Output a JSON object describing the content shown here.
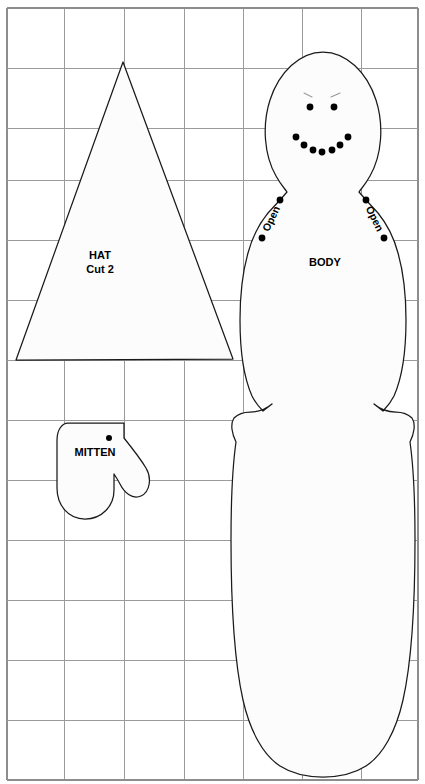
{
  "sheet": {
    "title": "Snowman Sewing Pattern Sheet",
    "width": 425,
    "height": 784,
    "background_color": "#ffffff"
  },
  "grid": {
    "line_color": "#9b9b9b",
    "border_color": "#8d8d8d",
    "x_lines": [
      7,
      64,
      124,
      184,
      243,
      302,
      361,
      418
    ],
    "y_lines": [
      8,
      68,
      128,
      180,
      240,
      300,
      360,
      420,
      480,
      540,
      600,
      660,
      720,
      780
    ],
    "left": 7,
    "right": 418,
    "top": 8,
    "bottom": 780
  },
  "pieces": {
    "hat": {
      "label": "HAT",
      "cut_label": "Cut 2",
      "label_x": 100,
      "label_y": 256,
      "cut_label_x": 100,
      "cut_label_y": 270,
      "apex_x": 123,
      "apex_y": 62,
      "base_left_x": 16,
      "base_right_x": 233,
      "base_y": 360,
      "outline_path": "M 123 62 L 233 359 L 16 360 Z",
      "fill_color": "#fcfcfc",
      "stroke_color": "#1a1a1a"
    },
    "mitten": {
      "label": "MITTEN",
      "label_x": 95,
      "label_y": 453,
      "top_y": 423,
      "bottom_y": 518,
      "left_x": 57,
      "right_x": 148,
      "outline_path": "M 68 423 L 124 423 L 124 438 C 132 448 140 458 146 468 C 152 478 150 492 141 496 C 132 500 124 492 120 484 C 118 480 116 477 114 474 L 114 490 C 114 506 102 519 85 519 C 68 519 57 505 57 488 L 57 440 C 57 430 62 423 68 423 Z",
      "mark_dot": {
        "x": 109,
        "y": 438,
        "r": 3.0
      },
      "fill_color": "#fcfcfc",
      "stroke_color": "#1a1a1a"
    },
    "body": {
      "label": "BODY",
      "label_x": 325,
      "label_y": 263,
      "head_top_y": 52,
      "body_bottom_y": 773,
      "center_x": 323,
      "left_x": 232,
      "right_x": 414,
      "outline_path": "M 323 52 C 300 52 279 72 270 100 C 262 125 264 155 276 176 C 281 185 285 189 287 192 L 280 200 L 268 213 C 259 224 252 238 248 253 C 242 274 240 298 240 320 C 240 350 244 378 252 396 C 256 404 260 408 263 411 L 272 404 C 265 410 258 412 250 412 C 243 412 238 414 234 418 C 230 424 232 434 236 442 C 232 470 231 500 231 540 C 231 600 234 660 243 700 C 250 731 263 755 280 766 C 294 775 310 777 323 777 C 336 777 352 775 366 766 C 383 755 396 731 403 700 C 412 660 415 600 415 540 C 415 500 414 470 410 442 C 414 434 416 424 412 418 C 408 414 403 412 396 412 C 388 412 381 410 374 404 L 383 411 C 386 408 390 404 394 396 C 402 378 406 350 406 320 C 406 298 404 274 398 253 C 394 238 387 224 378 213 L 366 200 L 359 192 C 361 189 365 185 370 176 C 382 155 384 125 376 100 C 367 72 346 52 323 52 Z",
      "fill_color": "#fcfcfc",
      "stroke_color": "#1a1a1a"
    }
  },
  "face": {
    "eyes": [
      {
        "x": 310,
        "y": 107,
        "r": 3.4
      },
      {
        "x": 334,
        "y": 107,
        "r": 3.4
      }
    ],
    "eyebrows": [
      {
        "x1": 304,
        "y1": 93,
        "x2": 312,
        "y2": 97
      },
      {
        "x1": 340,
        "y1": 93,
        "x2": 331,
        "y2": 97
      }
    ],
    "mouth": [
      {
        "x": 296,
        "y": 137,
        "r": 3.4
      },
      {
        "x": 304,
        "y": 145,
        "r": 3.4
      },
      {
        "x": 313,
        "y": 150,
        "r": 3.4
      },
      {
        "x": 322,
        "y": 152,
        "r": 3.4
      },
      {
        "x": 332,
        "y": 150,
        "r": 3.4
      },
      {
        "x": 340,
        "y": 145,
        "r": 3.4
      },
      {
        "x": 348,
        "y": 137,
        "r": 3.4
      }
    ],
    "dot_color": "#000000",
    "brow_color": "#999999"
  },
  "open_markings": {
    "label": "Open",
    "left": {
      "label_x": 272,
      "label_y": 219,
      "rotation": -64,
      "dot_top": {
        "x": 280,
        "y": 200,
        "r": 3.4
      },
      "dot_bottom": {
        "x": 262,
        "y": 238,
        "r": 3.4
      }
    },
    "right": {
      "label_x": 374,
      "label_y": 219,
      "rotation": 64,
      "dot_top": {
        "x": 366,
        "y": 200,
        "r": 3.4
      },
      "dot_bottom": {
        "x": 384,
        "y": 238,
        "r": 3.4
      }
    }
  }
}
